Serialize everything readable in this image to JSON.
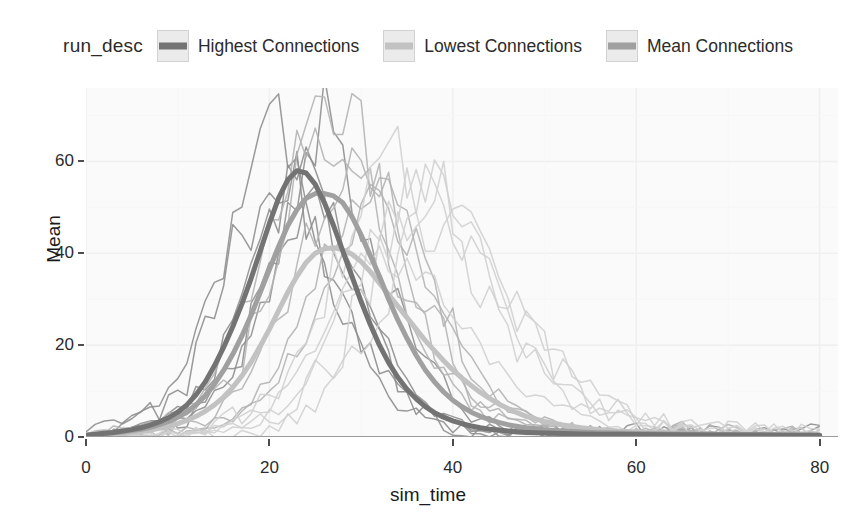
{
  "legend": {
    "title": "run_desc",
    "entries": [
      {
        "label": "Highest Connections",
        "color": "#737373"
      },
      {
        "label": "Lowest Connections",
        "color": "#c2c2c2"
      },
      {
        "label": "Mean Connections",
        "color": "#a0a0a0"
      }
    ]
  },
  "chart_data": {
    "type": "line",
    "title": "",
    "xlabel": "sim_time",
    "ylabel": "Mean",
    "xlim": [
      0,
      82
    ],
    "ylim": [
      0,
      76
    ],
    "xticks": [
      0,
      20,
      40,
      60,
      80
    ],
    "yticks": [
      0,
      20,
      40,
      60
    ],
    "grid": true,
    "legend_position": "top",
    "legend_title": "run_desc",
    "panel_background": "#fafafa",
    "grid_color": "#f0f0f0",
    "note": "Three groups of simulation runs; thin noisy lines are individual runs, thick smooth lines are the per-group mean.",
    "series": [
      {
        "name": "Highest Connections",
        "color": "#737373",
        "role": "mean",
        "width": 5,
        "x": [
          0,
          1,
          2,
          3,
          4,
          5,
          6,
          7,
          8,
          9,
          10,
          11,
          12,
          13,
          14,
          15,
          16,
          17,
          18,
          19,
          20,
          21,
          22,
          23,
          24,
          25,
          26,
          27,
          28,
          29,
          30,
          31,
          32,
          33,
          34,
          35,
          36,
          37,
          38,
          39,
          40,
          41,
          42,
          43,
          44,
          45,
          46,
          47,
          48,
          50,
          52,
          54,
          56,
          58,
          60,
          64,
          68,
          72,
          76,
          80
        ],
        "y": [
          0.4,
          0.6,
          0.8,
          1.0,
          1.3,
          1.6,
          2.0,
          2.6,
          3.3,
          4.2,
          5.4,
          7.0,
          9.2,
          12.0,
          15.5,
          19.5,
          24.0,
          29.0,
          34.5,
          40.5,
          46.5,
          52.0,
          56.0,
          58.0,
          57.5,
          55.0,
          51.0,
          46.0,
          40.5,
          35.0,
          29.5,
          24.5,
          20.0,
          16.2,
          13.0,
          10.4,
          8.3,
          6.6,
          5.3,
          4.3,
          3.5,
          2.9,
          2.4,
          2.0,
          1.7,
          1.5,
          1.3,
          1.1,
          1.0,
          0.85,
          0.75,
          0.68,
          0.62,
          0.58,
          0.55,
          0.5,
          0.46,
          0.43,
          0.4,
          0.38
        ]
      },
      {
        "name": "Mean Connections",
        "color": "#a0a0a0",
        "role": "mean",
        "width": 5,
        "x": [
          0,
          1,
          2,
          3,
          4,
          5,
          6,
          7,
          8,
          9,
          10,
          11,
          12,
          13,
          14,
          15,
          16,
          17,
          18,
          19,
          20,
          21,
          22,
          23,
          24,
          25,
          26,
          27,
          28,
          29,
          30,
          31,
          32,
          33,
          34,
          35,
          36,
          37,
          38,
          39,
          40,
          41,
          42,
          43,
          44,
          45,
          46,
          47,
          48,
          50,
          52,
          54,
          56,
          58,
          60,
          64,
          68,
          72,
          76,
          80
        ],
        "y": [
          0.4,
          0.5,
          0.7,
          0.9,
          1.1,
          1.4,
          1.7,
          2.1,
          2.7,
          3.4,
          4.3,
          5.5,
          7.0,
          9.0,
          11.5,
          14.5,
          18.0,
          22.0,
          26.5,
          31.5,
          36.5,
          41.5,
          46.0,
          49.5,
          52.0,
          53.0,
          53.0,
          52.5,
          51.0,
          48.0,
          44.0,
          39.5,
          35.0,
          30.0,
          25.5,
          21.5,
          17.8,
          14.6,
          12.0,
          9.8,
          8.0,
          6.6,
          5.4,
          4.5,
          3.8,
          3.2,
          2.7,
          2.3,
          2.0,
          1.6,
          1.3,
          1.1,
          0.95,
          0.85,
          0.78,
          0.66,
          0.58,
          0.5,
          0.45,
          0.4
        ]
      },
      {
        "name": "Lowest Connections",
        "color": "#c2c2c2",
        "role": "mean",
        "width": 5,
        "x": [
          0,
          1,
          2,
          3,
          4,
          5,
          6,
          7,
          8,
          9,
          10,
          11,
          12,
          13,
          14,
          15,
          16,
          17,
          18,
          19,
          20,
          21,
          22,
          23,
          24,
          25,
          26,
          27,
          28,
          29,
          30,
          31,
          32,
          33,
          34,
          35,
          36,
          37,
          38,
          39,
          40,
          41,
          42,
          43,
          44,
          45,
          46,
          47,
          48,
          50,
          52,
          54,
          56,
          58,
          60,
          64,
          68,
          72,
          76,
          80
        ],
        "y": [
          0.3,
          0.4,
          0.5,
          0.6,
          0.8,
          1.0,
          1.2,
          1.5,
          1.9,
          2.3,
          2.9,
          3.6,
          4.5,
          5.6,
          7.0,
          8.7,
          10.8,
          13.3,
          16.3,
          19.8,
          23.5,
          27.5,
          31.5,
          35.0,
          38.0,
          40.0,
          41.0,
          41.2,
          40.8,
          39.8,
          38.2,
          36.0,
          33.5,
          31.0,
          28.5,
          26.0,
          23.5,
          21.0,
          18.8,
          16.6,
          14.6,
          12.8,
          11.2,
          9.7,
          8.4,
          7.2,
          6.2,
          5.3,
          4.5,
          3.4,
          2.6,
          2.0,
          1.6,
          1.3,
          1.1,
          0.8,
          0.62,
          0.5,
          0.42,
          0.36
        ]
      }
    ],
    "run_envelopes": [
      {
        "group": "Highest Connections",
        "color": "#8c8c8c",
        "peak_x": 22,
        "peak_y_range": [
          60,
          73
        ],
        "end_x": 62
      },
      {
        "group": "Mean Connections",
        "color": "#b0b0b0",
        "peak_x": 27,
        "peak_y_range": [
          55,
          74
        ],
        "end_x": 66
      },
      {
        "group": "Lowest Connections",
        "color": "#cfcfcf",
        "peak_x": 34,
        "peak_y_range": [
          50,
          70
        ],
        "end_x": 74
      }
    ]
  }
}
